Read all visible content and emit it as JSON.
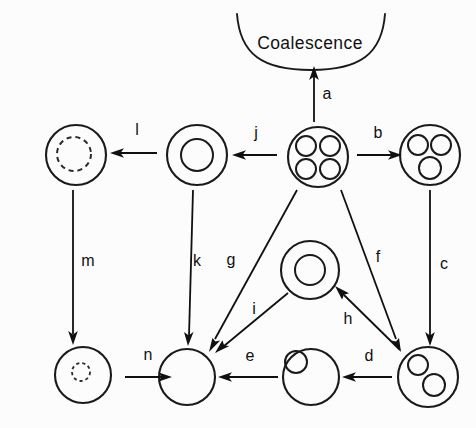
{
  "figure": {
    "background_color": "#fcfcfc",
    "stroke_color": "#1a1a1a",
    "title": "Coalescence",
    "title_position": {
      "x": 310,
      "y": 44
    }
  },
  "nodes": [
    {
      "id": "quad-vesicle",
      "name": "vesicle-with-four-inclusions",
      "cx": 318,
      "cy": 157,
      "r": 30,
      "inner": [
        {
          "cx": 306,
          "cy": 146,
          "r": 10,
          "style": "solid"
        },
        {
          "cx": 330,
          "cy": 146,
          "r": 10,
          "style": "solid"
        },
        {
          "cx": 306,
          "cy": 169,
          "r": 10,
          "style": "solid"
        },
        {
          "cx": 330,
          "cy": 169,
          "r": 10,
          "style": "solid"
        }
      ]
    },
    {
      "id": "triple-vesicle",
      "name": "vesicle-with-three-inclusions",
      "cx": 430,
      "cy": 155,
      "r": 30,
      "inner": [
        {
          "cx": 418,
          "cy": 145,
          "r": 10,
          "style": "solid"
        },
        {
          "cx": 441,
          "cy": 145,
          "r": 10,
          "style": "solid"
        },
        {
          "cx": 430,
          "cy": 168,
          "r": 11,
          "style": "solid"
        }
      ]
    },
    {
      "id": "double-vesicle",
      "name": "vesicle-with-two-inclusions",
      "cx": 428,
      "cy": 377,
      "r": 30,
      "inner": [
        {
          "cx": 418,
          "cy": 365,
          "r": 10,
          "style": "solid"
        },
        {
          "cx": 434,
          "cy": 385,
          "r": 11,
          "style": "solid"
        }
      ]
    },
    {
      "id": "single-vesicle",
      "name": "vesicle-with-one-inclusion",
      "cx": 311,
      "cy": 377,
      "r": 28,
      "inner": [
        {
          "cx": 296,
          "cy": 362,
          "r": 11,
          "style": "solid"
        }
      ]
    },
    {
      "id": "empty-vesicle",
      "name": "empty-vesicle",
      "cx": 187,
      "cy": 377,
      "r": 28,
      "inner": []
    },
    {
      "id": "dashed-small-vesicle",
      "name": "vesicle-with-small-dashed-inclusion",
      "cx": 83,
      "cy": 375,
      "r": 28,
      "inner": [
        {
          "cx": 81,
          "cy": 372,
          "r": 9,
          "style": "dashed-small"
        }
      ]
    },
    {
      "id": "dashed-large-vesicle",
      "name": "vesicle-with-large-dashed-inclusion",
      "cx": 76,
      "cy": 155,
      "r": 30,
      "inner": [
        {
          "cx": 74,
          "cy": 154,
          "r": 17,
          "style": "dashed"
        }
      ]
    },
    {
      "id": "ring-vesicle-top",
      "name": "vesicle-with-concentric-ring",
      "cx": 197,
      "cy": 155,
      "r": 30,
      "inner": [
        {
          "cx": 197,
          "cy": 155,
          "r": 16,
          "style": "solid"
        }
      ]
    },
    {
      "id": "ring-vesicle-center",
      "name": "center-vesicle-with-concentric-ring",
      "cx": 310,
      "cy": 270,
      "r": 29,
      "inner": [
        {
          "cx": 310,
          "cy": 270,
          "r": 15,
          "style": "solid"
        }
      ]
    }
  ],
  "arrows": [
    {
      "id": "a",
      "label": "a",
      "from": "quad-vesicle",
      "to": "coalescence-arc",
      "x1": 314,
      "y1": 122,
      "x2": 314,
      "y2": 70,
      "label_x": 327,
      "label_y": 95
    },
    {
      "id": "b",
      "label": "b",
      "from": "quad-vesicle",
      "to": "triple-vesicle",
      "x1": 357,
      "y1": 155,
      "x2": 396,
      "y2": 155,
      "label_x": 378,
      "label_y": 134
    },
    {
      "id": "c",
      "label": "c",
      "from": "triple-vesicle",
      "to": "double-vesicle",
      "x1": 430,
      "y1": 190,
      "x2": 430,
      "y2": 342,
      "label_x": 444,
      "label_y": 265
    },
    {
      "id": "d",
      "label": "d",
      "from": "double-vesicle",
      "to": "single-vesicle",
      "x1": 392,
      "y1": 377,
      "x2": 346,
      "y2": 377,
      "label_x": 369,
      "label_y": 357
    },
    {
      "id": "e",
      "label": "e",
      "from": "single-vesicle",
      "to": "empty-vesicle",
      "x1": 278,
      "y1": 377,
      "x2": 222,
      "y2": 377,
      "label_x": 250,
      "label_y": 357
    },
    {
      "id": "f",
      "label": "f",
      "from": "quad-vesicle",
      "to": "double-vesicle",
      "x1": 341,
      "y1": 190,
      "x2": 400,
      "y2": 348,
      "label_x": 378,
      "label_y": 258
    },
    {
      "id": "g",
      "label": "g",
      "from": "quad-vesicle",
      "to": "empty-vesicle",
      "x1": 297,
      "y1": 190,
      "x2": 210,
      "y2": 348,
      "label_x": 231,
      "label_y": 261
    },
    {
      "id": "h",
      "label": "h",
      "from": "double-vesicle",
      "to": "ring-vesicle-center",
      "x1": 400,
      "y1": 350,
      "x2": 337,
      "y2": 288,
      "label_x": 348,
      "label_y": 320
    },
    {
      "id": "i",
      "label": "i",
      "from": "ring-vesicle-center",
      "to": "empty-vesicle",
      "x1": 288,
      "y1": 293,
      "x2": 219,
      "y2": 350,
      "label_x": 254,
      "label_y": 310
    },
    {
      "id": "j",
      "label": "j",
      "from": "quad-vesicle",
      "to": "ring-vesicle-top",
      "x1": 277,
      "y1": 155,
      "x2": 236,
      "y2": 155,
      "label_x": 256,
      "label_y": 134
    },
    {
      "id": "k",
      "label": "k",
      "from": "ring-vesicle-top",
      "to": "empty-vesicle",
      "x1": 193,
      "y1": 190,
      "x2": 188,
      "y2": 342,
      "label_x": 197,
      "label_y": 262
    },
    {
      "id": "l",
      "label": "l",
      "from": "ring-vesicle-top",
      "to": "dashed-large-vesicle",
      "x1": 157,
      "y1": 153,
      "x2": 114,
      "y2": 153,
      "label_x": 137,
      "label_y": 131
    },
    {
      "id": "m",
      "label": "m",
      "from": "dashed-large-vesicle",
      "to": "dashed-small-vesicle",
      "x1": 73,
      "y1": 190,
      "x2": 73,
      "y2": 340,
      "label_x": 88,
      "label_y": 262
    },
    {
      "id": "n",
      "label": "n",
      "from": "dashed-small-vesicle",
      "to": "empty-vesicle",
      "x1": 125,
      "y1": 377,
      "x2": 172,
      "y2": 377,
      "label_x": 148,
      "label_y": 356
    }
  ],
  "coalescence_arc": {
    "name": "coalescence-arc",
    "path": "M 237 14 C 240 54, 262 70, 311 70 C 360 70, 382 54, 385 14"
  }
}
